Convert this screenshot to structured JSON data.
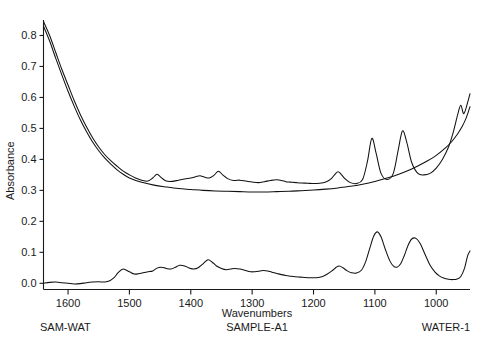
{
  "chart_data": {
    "type": "line",
    "title": "",
    "xlabel": "Wavenumbers",
    "ylabel": "Absorbance",
    "xlim": [
      1640,
      945
    ],
    "ylim": [
      -0.02,
      0.85
    ],
    "x_ticks": [
      1600,
      1500,
      1400,
      1300,
      1200,
      1100,
      1000
    ],
    "y_ticks": [
      "0.0",
      "0.1",
      "0.2",
      "0.3",
      "0.4",
      "0.5",
      "0.6",
      "0.7",
      "0.8"
    ],
    "x_direction": "descending",
    "grid": false,
    "legend": "none",
    "axis_color": "#1a1a1a",
    "trace_color": "#111111",
    "series": [
      {
        "name": "SAMPLE-A1",
        "role": "sample-spectrum",
        "x": [
          1640,
          1630,
          1620,
          1610,
          1600,
          1590,
          1580,
          1570,
          1560,
          1550,
          1540,
          1530,
          1520,
          1510,
          1500,
          1490,
          1480,
          1470,
          1462,
          1455,
          1448,
          1440,
          1430,
          1420,
          1410,
          1400,
          1392,
          1385,
          1378,
          1370,
          1362,
          1355,
          1348,
          1340,
          1330,
          1320,
          1310,
          1300,
          1290,
          1280,
          1270,
          1260,
          1250,
          1245,
          1240,
          1235,
          1228,
          1220,
          1210,
          1200,
          1190,
          1180,
          1172,
          1165,
          1160,
          1155,
          1148,
          1140,
          1130,
          1120,
          1112,
          1105,
          1098,
          1090,
          1080,
          1070,
          1062,
          1055,
          1048,
          1040,
          1030,
          1020,
          1010,
          1000,
          990,
          980,
          972,
          965,
          960,
          955,
          948,
          945
        ],
        "y": [
          0.845,
          0.8,
          0.745,
          0.69,
          0.64,
          0.59,
          0.545,
          0.505,
          0.47,
          0.44,
          0.415,
          0.395,
          0.378,
          0.362,
          0.35,
          0.34,
          0.333,
          0.33,
          0.34,
          0.352,
          0.341,
          0.33,
          0.329,
          0.333,
          0.337,
          0.34,
          0.344,
          0.347,
          0.343,
          0.34,
          0.349,
          0.362,
          0.35,
          0.338,
          0.332,
          0.333,
          0.33,
          0.327,
          0.325,
          0.328,
          0.332,
          0.334,
          0.331,
          0.328,
          0.327,
          0.326,
          0.325,
          0.324,
          0.323,
          0.322,
          0.323,
          0.327,
          0.336,
          0.352,
          0.36,
          0.352,
          0.336,
          0.325,
          0.322,
          0.335,
          0.395,
          0.468,
          0.42,
          0.355,
          0.335,
          0.355,
          0.43,
          0.492,
          0.455,
          0.39,
          0.355,
          0.35,
          0.355,
          0.372,
          0.4,
          0.44,
          0.49,
          0.545,
          0.575,
          0.548,
          0.59,
          0.612
        ]
      },
      {
        "name": "WATER-1",
        "role": "water-reference",
        "x": [
          1640,
          1630,
          1620,
          1610,
          1600,
          1590,
          1580,
          1570,
          1560,
          1550,
          1540,
          1530,
          1520,
          1510,
          1500,
          1480,
          1460,
          1440,
          1420,
          1400,
          1380,
          1360,
          1340,
          1320,
          1300,
          1280,
          1260,
          1240,
          1220,
          1200,
          1180,
          1160,
          1140,
          1120,
          1100,
          1080,
          1060,
          1040,
          1020,
          1000,
          985,
          975,
          965,
          958,
          952,
          948,
          945
        ],
        "y": [
          0.83,
          0.782,
          0.726,
          0.672,
          0.62,
          0.572,
          0.528,
          0.49,
          0.456,
          0.428,
          0.404,
          0.384,
          0.366,
          0.352,
          0.34,
          0.326,
          0.317,
          0.311,
          0.306,
          0.303,
          0.3,
          0.298,
          0.297,
          0.296,
          0.295,
          0.295,
          0.296,
          0.297,
          0.299,
          0.301,
          0.304,
          0.308,
          0.313,
          0.32,
          0.329,
          0.34,
          0.353,
          0.369,
          0.389,
          0.413,
          0.437,
          0.457,
          0.483,
          0.505,
          0.53,
          0.552,
          0.57
        ]
      },
      {
        "name": "SAM-WAT",
        "role": "difference-spectrum",
        "x": [
          1640,
          1630,
          1620,
          1610,
          1600,
          1590,
          1580,
          1570,
          1560,
          1550,
          1540,
          1532,
          1525,
          1518,
          1510,
          1500,
          1492,
          1485,
          1478,
          1470,
          1462,
          1455,
          1448,
          1440,
          1432,
          1425,
          1418,
          1410,
          1402,
          1395,
          1388,
          1380,
          1372,
          1365,
          1358,
          1350,
          1342,
          1335,
          1328,
          1320,
          1312,
          1305,
          1298,
          1290,
          1282,
          1275,
          1268,
          1260,
          1252,
          1245,
          1238,
          1230,
          1222,
          1215,
          1208,
          1200,
          1192,
          1185,
          1178,
          1170,
          1163,
          1158,
          1152,
          1145,
          1138,
          1130,
          1122,
          1115,
          1108,
          1102,
          1096,
          1090,
          1083,
          1076,
          1070,
          1064,
          1058,
          1052,
          1046,
          1040,
          1033,
          1026,
          1018,
          1010,
          1002,
          995,
          988,
          980,
          972,
          966,
          960,
          954,
          949,
          945
        ],
        "y": [
          0.0,
          0.003,
          0.004,
          0.002,
          0.0,
          -0.002,
          -0.001,
          0.002,
          0.004,
          0.005,
          0.004,
          0.008,
          0.018,
          0.035,
          0.046,
          0.037,
          0.03,
          0.031,
          0.034,
          0.037,
          0.04,
          0.049,
          0.052,
          0.048,
          0.046,
          0.052,
          0.058,
          0.056,
          0.049,
          0.046,
          0.05,
          0.063,
          0.076,
          0.068,
          0.056,
          0.048,
          0.044,
          0.046,
          0.048,
          0.046,
          0.042,
          0.038,
          0.037,
          0.039,
          0.041,
          0.04,
          0.036,
          0.032,
          0.028,
          0.025,
          0.023,
          0.021,
          0.02,
          0.019,
          0.018,
          0.018,
          0.019,
          0.022,
          0.029,
          0.04,
          0.052,
          0.056,
          0.05,
          0.04,
          0.034,
          0.033,
          0.042,
          0.07,
          0.115,
          0.152,
          0.166,
          0.15,
          0.11,
          0.074,
          0.056,
          0.052,
          0.063,
          0.09,
          0.122,
          0.143,
          0.145,
          0.128,
          0.092,
          0.058,
          0.036,
          0.024,
          0.017,
          0.013,
          0.012,
          0.014,
          0.022,
          0.048,
          0.088,
          0.104
        ]
      }
    ]
  },
  "axis": {
    "y_title": "Absorbance",
    "x_title": "Wavenumbers"
  },
  "captions": {
    "left": "SAM-WAT",
    "center": "SAMPLE-A1",
    "right": "WATER-1"
  }
}
